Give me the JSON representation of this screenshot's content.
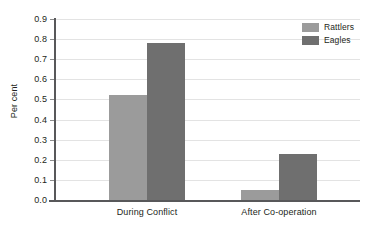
{
  "chart_data": {
    "type": "bar",
    "title": "",
    "xlabel": "",
    "ylabel": "Per cent",
    "categories": [
      "During Conflict",
      "After Co-operation"
    ],
    "series": [
      {
        "name": "Rattlers",
        "color": "#9b9b9b",
        "values": [
          0.52,
          0.05
        ]
      },
      {
        "name": "Eagles",
        "color": "#6f6f6f",
        "values": [
          0.78,
          0.23
        ]
      }
    ],
    "ylim": [
      0.0,
      0.9
    ],
    "ytick_step": 0.1,
    "yticks": [
      "0.0",
      "0.1",
      "0.2",
      "0.3",
      "0.4",
      "0.5",
      "0.6",
      "0.7",
      "0.8",
      "0.9"
    ],
    "grid": true,
    "legend_position": "top-right",
    "grid_color": "#e3e3e3",
    "axis_color": "#58585a",
    "background": "#ffffff"
  }
}
